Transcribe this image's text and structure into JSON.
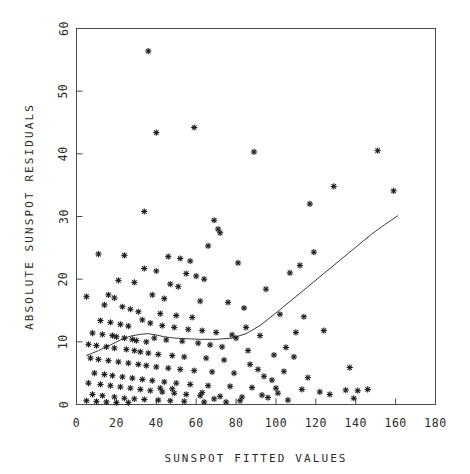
{
  "chart_data": {
    "type": "scatter",
    "title": "",
    "xlabel": "SUNSPOT FITTED VALUES",
    "ylabel": "ABSOLUTE SUNSPOT RESIDUALS",
    "xlim": [
      0,
      180
    ],
    "ylim": [
      0,
      60
    ],
    "xticks": [
      0,
      20,
      40,
      60,
      80,
      100,
      120,
      140,
      160,
      180
    ],
    "yticks": [
      0,
      10,
      20,
      30,
      40,
      50,
      60
    ],
    "xtick_labels": [
      "0",
      "20",
      "40",
      "60",
      "80",
      "100",
      "120",
      "140",
      "160",
      "180"
    ],
    "ytick_labels": [
      "0",
      "10",
      "20",
      "30",
      "40",
      "50",
      "60"
    ],
    "grid": false,
    "legend": null,
    "marker": "asterisk",
    "marker_color": "#1a1a1a",
    "frame_color": "#4a4a4a",
    "background_color": "#ffffff",
    "series": [
      {
        "name": "absolute residuals",
        "type": "scatter",
        "points": [
          [
            36,
            56.4
          ],
          [
            40,
            43.4
          ],
          [
            59,
            44.2
          ],
          [
            89,
            40.3
          ],
          [
            151,
            40.5
          ],
          [
            159,
            34.1
          ],
          [
            129,
            34.8
          ],
          [
            117,
            32.0
          ],
          [
            34,
            30.8
          ],
          [
            69,
            29.4
          ],
          [
            71,
            28.0
          ],
          [
            72,
            27.4
          ],
          [
            66,
            25.3
          ],
          [
            119,
            24.3
          ],
          [
            11,
            24.0
          ],
          [
            24,
            23.8
          ],
          [
            46,
            23.6
          ],
          [
            52,
            23.3
          ],
          [
            57,
            22.9
          ],
          [
            81,
            22.6
          ],
          [
            112,
            22.2
          ],
          [
            107,
            21.0
          ],
          [
            34,
            21.7
          ],
          [
            40,
            21.3
          ],
          [
            55,
            20.9
          ],
          [
            60,
            20.5
          ],
          [
            64,
            20.0
          ],
          [
            21,
            19.8
          ],
          [
            29,
            19.5
          ],
          [
            47,
            19.2
          ],
          [
            51,
            18.8
          ],
          [
            95,
            18.4
          ],
          [
            5,
            17.2
          ],
          [
            16,
            17.5
          ],
          [
            19,
            17.0
          ],
          [
            38,
            17.5
          ],
          [
            44,
            16.9
          ],
          [
            62,
            16.5
          ],
          [
            76,
            16.3
          ],
          [
            84,
            15.4
          ],
          [
            102,
            14.4
          ],
          [
            114,
            14.0
          ],
          [
            14,
            15.9
          ],
          [
            23,
            15.6
          ],
          [
            27,
            15.2
          ],
          [
            31,
            14.8
          ],
          [
            42,
            14.5
          ],
          [
            50,
            14.2
          ],
          [
            58,
            13.9
          ],
          [
            12,
            13.4
          ],
          [
            17,
            13.1
          ],
          [
            22,
            12.8
          ],
          [
            26,
            12.5
          ],
          [
            33,
            13.5
          ],
          [
            37,
            13.0
          ],
          [
            43,
            12.6
          ],
          [
            49,
            12.3
          ],
          [
            56,
            12.0
          ],
          [
            63,
            11.8
          ],
          [
            70,
            11.5
          ],
          [
            78,
            11.1
          ],
          [
            8,
            11.4
          ],
          [
            13,
            11.2
          ],
          [
            18,
            11.0
          ],
          [
            20,
            10.8
          ],
          [
            24,
            10.6
          ],
          [
            28,
            10.4
          ],
          [
            30,
            10.2
          ],
          [
            35,
            10.0
          ],
          [
            39,
            10.6
          ],
          [
            45,
            10.3
          ],
          [
            53,
            10.1
          ],
          [
            61,
            9.8
          ],
          [
            67,
            9.5
          ],
          [
            73,
            9.2
          ],
          [
            6,
            9.6
          ],
          [
            10,
            9.4
          ],
          [
            15,
            9.2
          ],
          [
            19,
            9.0
          ],
          [
            25,
            8.8
          ],
          [
            29,
            8.6
          ],
          [
            32,
            8.4
          ],
          [
            36,
            8.2
          ],
          [
            41,
            8.0
          ],
          [
            48,
            7.8
          ],
          [
            54,
            7.6
          ],
          [
            65,
            7.4
          ],
          [
            74,
            7.1
          ],
          [
            86,
            8.6
          ],
          [
            99,
            7.9
          ],
          [
            109,
            7.6
          ],
          [
            7,
            7.4
          ],
          [
            11,
            7.2
          ],
          [
            16,
            7.0
          ],
          [
            21,
            6.8
          ],
          [
            26,
            6.6
          ],
          [
            31,
            6.4
          ],
          [
            35,
            6.2
          ],
          [
            40,
            6.0
          ],
          [
            46,
            5.8
          ],
          [
            52,
            5.6
          ],
          [
            59,
            5.4
          ],
          [
            68,
            5.2
          ],
          [
            79,
            5.0
          ],
          [
            91,
            5.6
          ],
          [
            104,
            5.3
          ],
          [
            137,
            5.9
          ],
          [
            9,
            5.0
          ],
          [
            14,
            4.8
          ],
          [
            18,
            4.6
          ],
          [
            23,
            4.4
          ],
          [
            28,
            4.2
          ],
          [
            33,
            4.0
          ],
          [
            38,
            3.8
          ],
          [
            44,
            3.6
          ],
          [
            50,
            3.4
          ],
          [
            57,
            3.2
          ],
          [
            66,
            3.0
          ],
          [
            77,
            2.9
          ],
          [
            88,
            2.7
          ],
          [
            100,
            2.6
          ],
          [
            6,
            3.4
          ],
          [
            12,
            3.2
          ],
          [
            17,
            3.0
          ],
          [
            22,
            2.8
          ],
          [
            27,
            2.6
          ],
          [
            32,
            2.4
          ],
          [
            37,
            2.2
          ],
          [
            43,
            2.0
          ],
          [
            49,
            1.8
          ],
          [
            55,
            1.6
          ],
          [
            62,
            1.4
          ],
          [
            72,
            1.3
          ],
          [
            83,
            1.2
          ],
          [
            96,
            1.1
          ],
          [
            8,
            1.6
          ],
          [
            13,
            1.4
          ],
          [
            19,
            1.2
          ],
          [
            24,
            1.0
          ],
          [
            29,
            0.9
          ],
          [
            34,
            0.8
          ],
          [
            41,
            0.7
          ],
          [
            47,
            0.6
          ],
          [
            54,
            0.5
          ],
          [
            64,
            0.4
          ],
          [
            75,
            0.4
          ],
          [
            5,
            0.6
          ],
          [
            10,
            0.5
          ],
          [
            15,
            0.4
          ],
          [
            20,
            0.3
          ],
          [
            26,
            0.3
          ],
          [
            42,
            2.6
          ],
          [
            48,
            2.5
          ],
          [
            63,
            1.9
          ],
          [
            69,
            0.9
          ],
          [
            82,
            0.6
          ],
          [
            93,
            1.5
          ],
          [
            106,
            0.7
          ],
          [
            113,
            2.4
          ],
          [
            98,
            3.9
          ],
          [
            105,
            9.1
          ],
          [
            110,
            11.5
          ],
          [
            124,
            11.8
          ],
          [
            92,
            11.0
          ],
          [
            85,
            12.3
          ],
          [
            80,
            10.6
          ],
          [
            87,
            6.4
          ],
          [
            94,
            4.5
          ],
          [
            101,
            1.8
          ],
          [
            116,
            4.3
          ],
          [
            122,
            2.0
          ],
          [
            127,
            1.6
          ],
          [
            135,
            2.3
          ],
          [
            141,
            2.2
          ],
          [
            146,
            2.4
          ],
          [
            139,
            1.0
          ]
        ]
      },
      {
        "name": "lowess smooth",
        "type": "line",
        "points": [
          [
            5,
            7.8
          ],
          [
            11,
            8.6
          ],
          [
            17,
            9.5
          ],
          [
            22,
            10.3
          ],
          [
            27,
            10.9
          ],
          [
            32,
            11.2
          ],
          [
            36,
            11.3
          ],
          [
            40,
            11.1
          ],
          [
            44,
            10.8
          ],
          [
            49,
            10.6
          ],
          [
            55,
            10.5
          ],
          [
            62,
            10.4
          ],
          [
            70,
            10.4
          ],
          [
            78,
            10.6
          ],
          [
            85,
            11.3
          ],
          [
            92,
            12.6
          ],
          [
            100,
            14.6
          ],
          [
            108,
            16.7
          ],
          [
            116,
            18.8
          ],
          [
            124,
            20.9
          ],
          [
            132,
            23.0
          ],
          [
            140,
            25.1
          ],
          [
            148,
            27.2
          ],
          [
            155,
            28.8
          ],
          [
            161,
            30.1
          ]
        ]
      }
    ]
  }
}
